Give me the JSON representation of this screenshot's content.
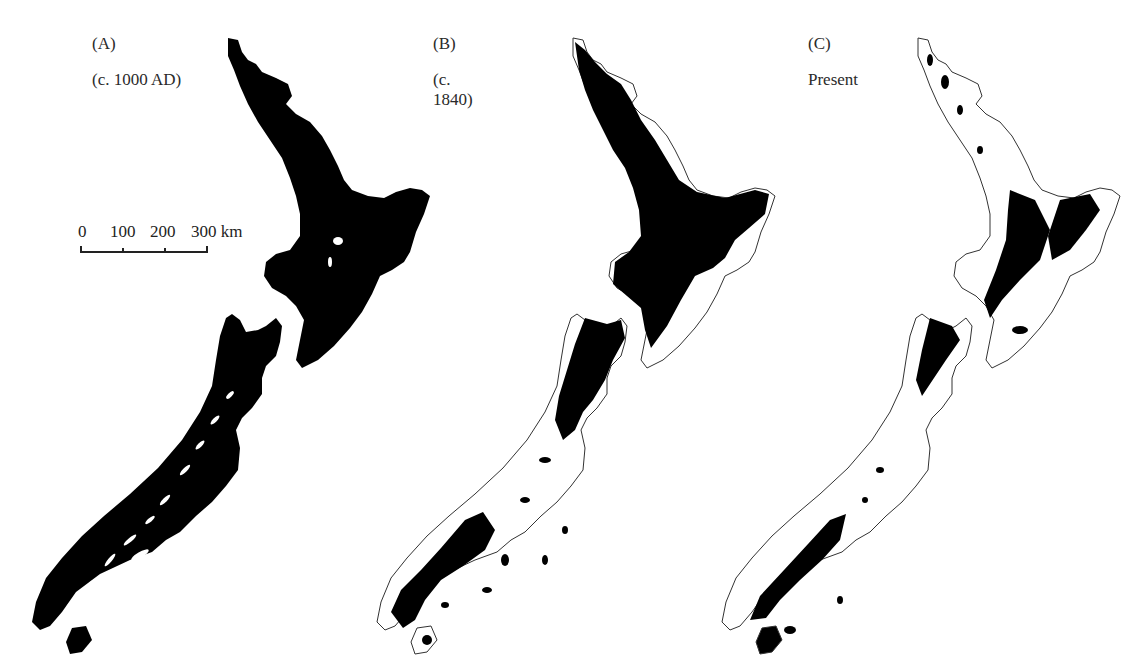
{
  "figure": {
    "panels": [
      {
        "id": "A",
        "label": "(A)",
        "period": "(c. 1000 AD)",
        "coverage": "full"
      },
      {
        "id": "B",
        "label": "(B)",
        "period": "(c. 1840)",
        "coverage": "partial"
      },
      {
        "id": "C",
        "label": "(C)",
        "period": "Present",
        "coverage": "sparse"
      }
    ],
    "scale_bar": {
      "ticks": [
        "0",
        "100",
        "200",
        "300 km"
      ],
      "unit": "km",
      "max": 300
    },
    "colors": {
      "land_fill": "#000000",
      "background": "#ffffff",
      "outline": "#333333"
    }
  }
}
